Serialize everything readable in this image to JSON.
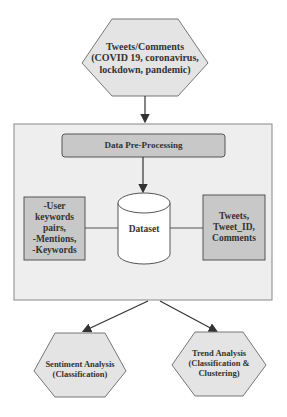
{
  "diagram": {
    "source": {
      "line1": "Tweets/Comments",
      "line2": "(COVID 19, coronavirus,",
      "line3": "lockdown, pandemic)"
    },
    "preprocessing": {
      "label": "Data Pre-Processing"
    },
    "dataset": {
      "label": "Dataset"
    },
    "left_box": {
      "line1": "-User",
      "line2": "keywords",
      "line3": "pairs,",
      "line4": "-Mentions,",
      "line5": "-Keywords"
    },
    "right_box": {
      "line1": "Tweets,",
      "line2": "Tweet_ID,",
      "line3": "Comments"
    },
    "sentiment": {
      "line1": "Sentiment Analysis",
      "line2": "(Classification)"
    },
    "trend": {
      "line1": "Trend Analysis",
      "line2": "(Classification &",
      "line3": "Clustering)"
    }
  },
  "colors": {
    "hexagon_fill": "#e4e4e4",
    "container_fill": "#eeeeee",
    "process_fill": "#c8c8c8",
    "box_fill": "#c8c8c8",
    "stroke": "#555555"
  }
}
